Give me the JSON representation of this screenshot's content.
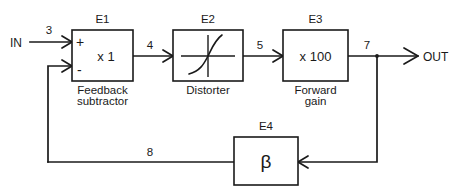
{
  "diagram": {
    "stroke_color": "#1a1a1a",
    "background_color": "#ffffff",
    "ports": {
      "input_label": "IN",
      "output_label": "OUT"
    },
    "blocks": [
      {
        "id": "E1",
        "name": "E1",
        "body": "x 1",
        "caption_line1": "Feedback",
        "caption_line2": "subtractor",
        "plus_sign": "+",
        "minus_sign": "-"
      },
      {
        "id": "E2",
        "name": "E2",
        "body": "",
        "caption_line1": "Distorter",
        "caption_line2": ""
      },
      {
        "id": "E3",
        "name": "E3",
        "body": "x 100",
        "caption_line1": "Forward",
        "caption_line2": "gain"
      },
      {
        "id": "E4",
        "name": "E4",
        "body": "β",
        "caption_line1": "",
        "caption_line2": ""
      }
    ],
    "signal_labels": [
      {
        "id": "s3",
        "text": "3"
      },
      {
        "id": "s4",
        "text": "4"
      },
      {
        "id": "s5",
        "text": "5"
      },
      {
        "id": "s7",
        "text": "7"
      },
      {
        "id": "s8",
        "text": "8"
      }
    ]
  }
}
